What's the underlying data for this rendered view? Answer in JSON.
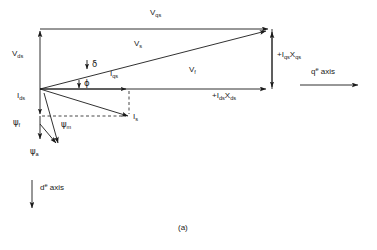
{
  "figure": {
    "caption": "(a)",
    "type": "phasor-diagram"
  },
  "axes": {
    "q_axis": {
      "symbol": "q",
      "superscript": "e",
      "word": "axis",
      "direction": "right"
    },
    "d_axis": {
      "symbol": "d",
      "superscript": "e",
      "word": "axis",
      "direction": "down"
    }
  },
  "vectors": [
    {
      "id": "v-qs",
      "base": "V",
      "sub": "qs",
      "label": "V_qs"
    },
    {
      "id": "v-ds",
      "base": "V",
      "sub": "ds",
      "label": "V_ds"
    },
    {
      "id": "v-s",
      "base": "V",
      "sub": "s",
      "label": "V_s"
    },
    {
      "id": "v-f",
      "base": "V",
      "sub": "f",
      "label": "V_f"
    },
    {
      "id": "i-qs",
      "base": "I",
      "sub": "qs",
      "label": "I_qs"
    },
    {
      "id": "i-ds",
      "base": "I",
      "sub": "ds",
      "label": "I_ds"
    },
    {
      "id": "i-s",
      "base": "I",
      "sub": "s",
      "label": "I_s"
    },
    {
      "id": "iqsxqs",
      "base": "+I",
      "sub": "qs",
      "base2": "X",
      "sub2": "qs",
      "label": "+I_qs X_qs"
    },
    {
      "id": "idsxds",
      "base": "+I",
      "sub": "ds",
      "base2": "X",
      "sub2": "ds",
      "label": "+I_ds X_ds"
    },
    {
      "id": "psi-f",
      "base": "ψ",
      "sub": "f",
      "label": "psi_f"
    },
    {
      "id": "psi-m",
      "base": "ψ",
      "sub": "m",
      "label": "psi_m"
    },
    {
      "id": "psi-a",
      "base": "ψ",
      "sub": "a",
      "label": "psi_a"
    }
  ],
  "angles": [
    {
      "id": "delta",
      "symbol": "δ",
      "name": "delta-load-angle"
    },
    {
      "id": "phi",
      "symbol": "ϕ",
      "name": "phi-power-factor-angle"
    }
  ],
  "text": {
    "v_qs_base": "V",
    "v_qs_sub": "qs",
    "v_ds_base": "V",
    "v_ds_sub": "ds",
    "v_s_base": "V",
    "v_s_sub": "s",
    "v_f_base": "V",
    "v_f_sub": "f",
    "i_qs_base": "I",
    "i_qs_sub": "qs",
    "i_ds_base": "I",
    "i_ds_sub": "ds",
    "i_s_base": "I",
    "i_s_sub": "s",
    "iqsxqs_a": "+I",
    "iqsxqs_asub": "qs",
    "iqsxqs_b": "X",
    "iqsxqs_bsub": "qs",
    "idsxds_a": "+I",
    "idsxds_asub": "ds",
    "idsxds_b": "X",
    "idsxds_bsub": "ds",
    "psi_f_base": "ψ",
    "psi_f_sub": "f",
    "psi_m_base": "ψ",
    "psi_m_sub": "m",
    "psi_a_base": "ψ",
    "psi_a_sub": "a",
    "delta": "δ",
    "phi": "ϕ",
    "q_sym": "q",
    "q_sup": "e",
    "q_word": " axis",
    "d_sym": "d",
    "d_sup": "e",
    "d_word": " axis",
    "caption": "(a)"
  },
  "colors": {
    "line": "#1a1a1a",
    "background": "#ffffff",
    "text": "#1a1a1a"
  }
}
